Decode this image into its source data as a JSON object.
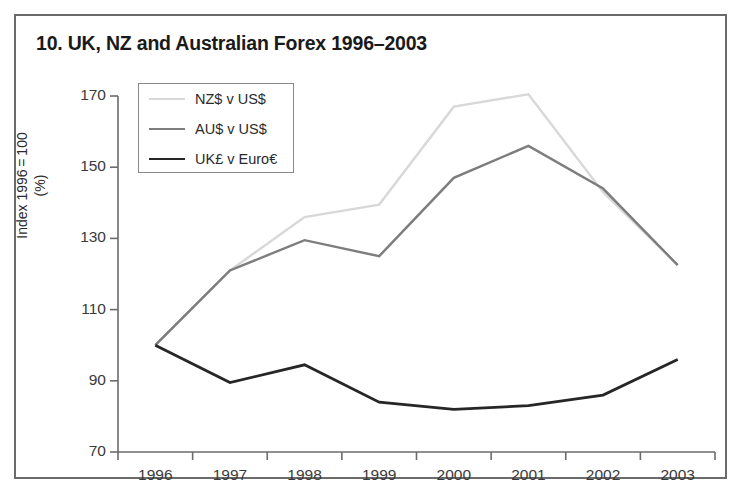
{
  "figure": {
    "title": "10. UK, NZ and Australian Forex 1996–2003",
    "border_color": "#6b6b6b",
    "background": "#ffffff"
  },
  "chart_data": {
    "type": "line",
    "title": "10. UK, NZ and Australian Forex 1996–2003",
    "xlabel": "",
    "ylabel": "Index 1996 = 100\n(%)",
    "ylim": [
      70,
      170
    ],
    "yticks": [
      70,
      90,
      110,
      130,
      150,
      170
    ],
    "ytick_labels": [
      "70",
      "90",
      "110",
      "130",
      "150",
      "170"
    ],
    "xlim": [
      1996,
      2004
    ],
    "xticks": [
      1996,
      1997,
      1998,
      1999,
      2000,
      2001,
      2002,
      2003,
      2004
    ],
    "xtick_labels": [
      "1996",
      "1997",
      "1998",
      "1999",
      "2000",
      "2001",
      "2002",
      "2003"
    ],
    "x": [
      1996.5,
      1997.5,
      1998.5,
      1999.5,
      2000.5,
      2001.5,
      2002.5,
      2003.5
    ],
    "grid": false,
    "legend_position": "upper left",
    "series": [
      {
        "name": "NZ$ v US$",
        "color": "#d8d8d8",
        "width": 2.4,
        "values": [
          100,
          121,
          136,
          139.5,
          167,
          170.5,
          143,
          122.5
        ]
      },
      {
        "name": "AU$ v US$",
        "color": "#7d7d7d",
        "width": 2.4,
        "values": [
          100,
          121,
          129.5,
          125,
          147,
          156,
          144,
          122.5
        ]
      },
      {
        "name": "UK£ v Euro€",
        "color": "#262626",
        "width": 2.8,
        "values": [
          100,
          89.5,
          94.5,
          84,
          82,
          83,
          86,
          96
        ]
      }
    ]
  },
  "legend": {
    "entries": [
      {
        "label": "NZ$ v US$"
      },
      {
        "label": "AU$ v US$"
      },
      {
        "label": "UK£ v Euro€"
      }
    ]
  },
  "axes": {
    "y_axis_label": "Index 1996 = 100\n(%)",
    "axis_color": "#6b6b6b"
  }
}
